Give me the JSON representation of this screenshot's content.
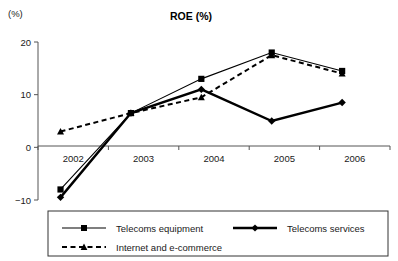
{
  "chart_data": {
    "type": "line",
    "title": "ROE  (%)",
    "xlabel": "",
    "ylabel": "(%)",
    "yunit": "(%)",
    "categories": [
      "2002",
      "2003",
      "2004",
      "2005",
      "2006"
    ],
    "ylim": [
      -10,
      20
    ],
    "yticks": [
      20,
      10,
      0,
      -10
    ],
    "ytick_labels": [
      "20",
      "10",
      "0",
      "-10"
    ],
    "grid": false,
    "legend_position": "bottom",
    "series": [
      {
        "name": "Telecoms equipment",
        "marker": "square",
        "line_style": "solid-thin",
        "values": [
          -8,
          6.5,
          13,
          18,
          14.5
        ]
      },
      {
        "name": "Telecoms services",
        "marker": "diamond",
        "line_style": "solid-thick",
        "values": [
          -9.5,
          6.5,
          11,
          5,
          8.5
        ]
      },
      {
        "name": "Internet and e-commerce",
        "marker": "triangle",
        "line_style": "dashed",
        "values": [
          3,
          6.5,
          9.5,
          17.5,
          14
        ]
      }
    ]
  },
  "legend": {
    "entries": [
      {
        "label": "Telecoms equipment"
      },
      {
        "label": "Telecoms services"
      },
      {
        "label": "Internet and e-commerce"
      }
    ]
  }
}
